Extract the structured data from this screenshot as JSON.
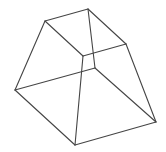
{
  "figure": {
    "type": "wireframe-frustum",
    "stroke_color": "#454545",
    "vertices": {
      "top_left": [
        45,
        21
      ],
      "top_back": [
        88,
        9
      ],
      "top_right": [
        126,
        44
      ],
      "top_front": [
        83,
        56
      ],
      "bottom_left": [
        15,
        90
      ],
      "bottom_back": [
        95,
        68
      ],
      "bottom_right": [
        156,
        122
      ],
      "bottom_front": [
        75,
        145
      ]
    },
    "edges": [
      [
        "top_left",
        "top_back"
      ],
      [
        "top_back",
        "top_right"
      ],
      [
        "top_right",
        "top_front"
      ],
      [
        "top_front",
        "top_left"
      ],
      [
        "top_back",
        "bottom_back"
      ],
      [
        "top_left",
        "bottom_left"
      ],
      [
        "top_right",
        "bottom_right"
      ],
      [
        "top_front",
        "bottom_front"
      ],
      [
        "bottom_left",
        "bottom_front"
      ],
      [
        "bottom_front",
        "bottom_right"
      ],
      [
        "bottom_left",
        "bottom_back"
      ],
      [
        "bottom_back",
        "bottom_right"
      ]
    ]
  }
}
